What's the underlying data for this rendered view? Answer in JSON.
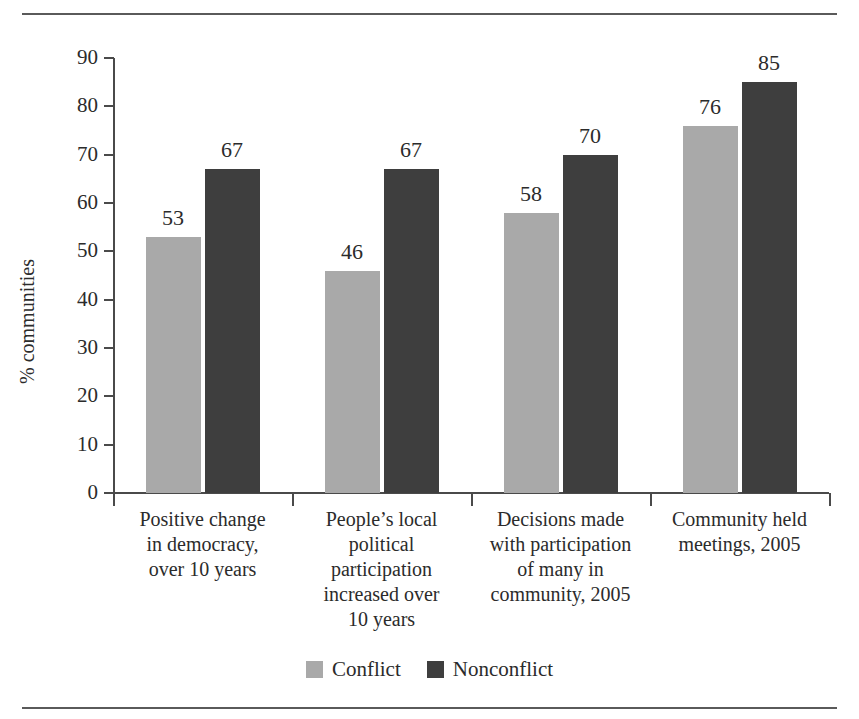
{
  "chart_data": {
    "type": "bar",
    "title": "",
    "xlabel": "",
    "ylabel": "% communities",
    "ylim": [
      0,
      90
    ],
    "ytick_step": 10,
    "yticks": [
      "90",
      "80",
      "70",
      "60",
      "50",
      "40",
      "30",
      "20",
      "10",
      "0"
    ],
    "grid": false,
    "legend_position": "bottom-center",
    "categories": [
      "Positive change in democracy, over 10 years",
      "People’s local political participation increased over 10 years",
      "Decisions made with participation of many in community, 2005",
      "Community held meetings, 2005"
    ],
    "category_lines": [
      [
        "Positive change",
        "in democracy,",
        "over 10 years"
      ],
      [
        "People’s local",
        "political",
        "participation",
        "increased over",
        "10 years"
      ],
      [
        "Decisions made",
        "with participation",
        "of many in",
        "community, 2005"
      ],
      [
        "Community held",
        "meetings, 2005"
      ]
    ],
    "series": [
      {
        "name": "Conflict",
        "color": "#a9a9a9",
        "values": [
          53,
          46,
          58,
          76
        ]
      },
      {
        "name": "Nonconflict",
        "color": "#3e3e3e",
        "values": [
          67,
          67,
          70,
          85
        ]
      }
    ]
  },
  "legend": {
    "items": [
      {
        "label": "Conflict",
        "color": "#a9a9a9"
      },
      {
        "label": "Nonconflict",
        "color": "#3e3e3e"
      }
    ]
  }
}
